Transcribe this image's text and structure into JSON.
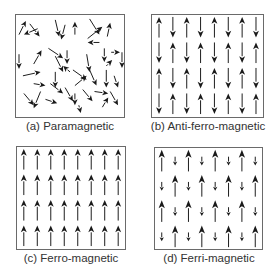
{
  "figure": {
    "panels": [
      {
        "id": "a",
        "caption": "(a) Paramagnetic",
        "type": "random"
      },
      {
        "id": "b",
        "caption": "(b) Anti-ferro-magnetic",
        "type": "antiparallel-equal"
      },
      {
        "id": "c",
        "caption": "(c) Ferro-magnetic",
        "type": "parallel"
      },
      {
        "id": "d",
        "caption": "(d) Ferri-magnetic",
        "type": "antiparallel-unequal"
      }
    ],
    "grid": {
      "columns": 8,
      "rows": 4
    },
    "colors": {
      "arrow": "#1a1a1a",
      "border": "#6a6a6a",
      "caption": "#333333"
    }
  }
}
